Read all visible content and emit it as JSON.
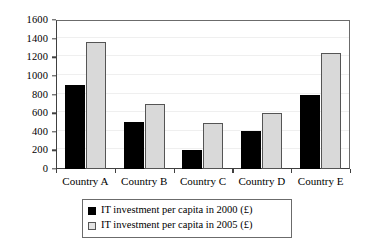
{
  "chart_data": {
    "type": "bar",
    "title": "",
    "xlabel": "",
    "ylabel": "",
    "ylim": [
      0,
      1600
    ],
    "ytick_step": 200,
    "yticks": [
      0,
      200,
      400,
      600,
      800,
      1000,
      1200,
      1400,
      1600
    ],
    "grid": true,
    "legend_position": "bottom",
    "categories": [
      "Country A",
      "Country B",
      "Country C",
      "Country D",
      "Country E"
    ],
    "series": [
      {
        "name": "IT investment per capita in 2000 (£)",
        "color": "#000000",
        "values": [
          900,
          500,
          200,
          410,
          800
        ]
      },
      {
        "name": "IT investment per capita in 2005 (£)",
        "color": "#d9d9d9",
        "values": [
          1360,
          700,
          490,
          600,
          1250
        ]
      }
    ]
  },
  "legend": {
    "items": [
      {
        "label": "IT investment per capita in 2000 (£)"
      },
      {
        "label": "IT investment per capita in 2005 (£)"
      }
    ]
  }
}
